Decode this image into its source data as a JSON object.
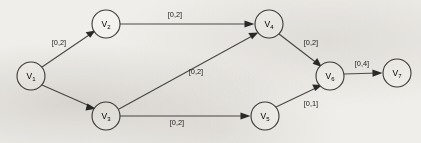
{
  "figure": {
    "background_color": "#f0eeea",
    "stroke_color": "#4a4a48",
    "node_fill_color": "#f4f2ee"
  },
  "nodes": [
    {
      "id": "v1",
      "label": "V",
      "sub": "1",
      "cx": 31,
      "cy": 76,
      "r": 14
    },
    {
      "id": "v2",
      "label": "V",
      "sub": "2",
      "cx": 106,
      "cy": 24,
      "r": 14
    },
    {
      "id": "v3",
      "label": "V",
      "sub": "3",
      "cx": 106,
      "cy": 116,
      "r": 14
    },
    {
      "id": "v4",
      "label": "V",
      "sub": "4",
      "cx": 269,
      "cy": 24,
      "r": 14
    },
    {
      "id": "v5",
      "label": "V",
      "sub": "5",
      "cx": 265,
      "cy": 116,
      "r": 14
    },
    {
      "id": "v6",
      "label": "V",
      "sub": "6",
      "cx": 330,
      "cy": 76,
      "r": 14
    },
    {
      "id": "v7",
      "label": "V",
      "sub": "7",
      "cx": 397,
      "cy": 73,
      "r": 14
    }
  ],
  "edges": [
    {
      "id": "e-v1-v2",
      "from": "V1",
      "to": "V2",
      "capacity": "[0,2]",
      "lower": 0,
      "upper": 2,
      "label_x": 59,
      "label_y": 42
    },
    {
      "id": "e-v1-v3",
      "from": "V1",
      "to": "V3",
      "capacity": "",
      "lower": 0,
      "upper": 2,
      "label_x": 0,
      "label_y": 0
    },
    {
      "id": "e-v2-v4",
      "from": "V2",
      "to": "V4",
      "capacity": "[0,2]",
      "lower": 0,
      "upper": 2,
      "label_x": 175,
      "label_y": 14
    },
    {
      "id": "e-v3-v4",
      "from": "V3",
      "to": "V4",
      "capacity": "[0,2]",
      "lower": 0,
      "upper": 2,
      "label_x": 196,
      "label_y": 71
    },
    {
      "id": "e-v3-v5",
      "from": "V3",
      "to": "V5",
      "capacity": "[0,2]",
      "lower": 0,
      "upper": 2,
      "label_x": 177,
      "label_y": 122
    },
    {
      "id": "e-v4-v6",
      "from": "V4",
      "to": "V6",
      "capacity": "[0,2]",
      "lower": 0,
      "upper": 2,
      "label_x": 311,
      "label_y": 42
    },
    {
      "id": "e-v5-v6",
      "from": "V5",
      "to": "V6",
      "capacity": "[0,1]",
      "lower": 0,
      "upper": 1,
      "label_x": 311,
      "label_y": 103
    },
    {
      "id": "e-v6-v7",
      "from": "V6",
      "to": "V7",
      "capacity": "[0,4]",
      "lower": 0,
      "upper": 4,
      "label_x": 362,
      "label_y": 63
    }
  ]
}
